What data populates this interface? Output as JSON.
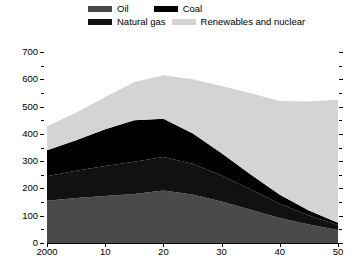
{
  "chart_data": {
    "type": "area",
    "stacked": true,
    "title": "",
    "subtitle": "",
    "xlabel": "",
    "ylabel": "",
    "x": [
      2000,
      2005,
      2010,
      2015,
      2020,
      2025,
      2030,
      2035,
      2040,
      2045,
      2050
    ],
    "xtick_labels": [
      "2000",
      "10",
      "20",
      "30",
      "40",
      "50"
    ],
    "xtick_values": [
      2000,
      2010,
      2020,
      2030,
      2040,
      2050
    ],
    "xlim": [
      2000,
      2050
    ],
    "ylim": [
      0,
      700
    ],
    "ytick_labels": [
      "0",
      "100",
      "200",
      "300",
      "400",
      "500",
      "600",
      "700"
    ],
    "ytick_values": [
      0,
      100,
      200,
      300,
      400,
      500,
      600,
      700
    ],
    "yminor_ticks": [
      50,
      150,
      250,
      350,
      450,
      550,
      650
    ],
    "grid": false,
    "legend_position": "top",
    "series": [
      {
        "name": "Oil",
        "color": "#4a4a4a",
        "values": [
          155,
          165,
          172,
          180,
          192,
          178,
          152,
          122,
          92,
          68,
          48
        ]
      },
      {
        "name": "Natural gas",
        "color": "#111111",
        "values": [
          90,
          100,
          110,
          118,
          123,
          112,
          95,
          74,
          52,
          33,
          18
        ]
      },
      {
        "name": "Coal",
        "color": "#000000",
        "values": [
          95,
          112,
          135,
          152,
          140,
          112,
          82,
          55,
          33,
          18,
          8
        ]
      },
      {
        "name": "Renewables and nuclear",
        "color": "#d4d4d4",
        "values": [
          88,
          100,
          118,
          140,
          160,
          198,
          246,
          298,
          343,
          400,
          451
        ]
      }
    ],
    "totals": [
      428,
      477,
      535,
      590,
      615,
      600,
      575,
      549,
      520,
      519,
      525
    ]
  },
  "legend": {
    "items": [
      {
        "label": "Oil",
        "color": "#4a4a4a",
        "icon": "legend-swatch-icon"
      },
      {
        "label": "Coal",
        "color": "#000000",
        "icon": "legend-swatch-icon"
      },
      {
        "label": "Natural gas",
        "color": "#111111",
        "icon": "legend-swatch-icon"
      },
      {
        "label": "Renewables and nuclear",
        "color": "#d4d4d4",
        "icon": "legend-swatch-icon"
      }
    ]
  }
}
